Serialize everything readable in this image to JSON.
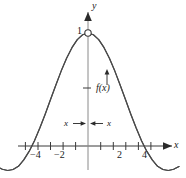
{
  "figure": {
    "title": "",
    "background": "#ffffff",
    "ink_color": "#3a3a3a",
    "text_color": "#1a1a1a"
  },
  "axes": {
    "x_axis_label": "x",
    "y_axis_label": "y",
    "x_tick_labels": [
      "−4",
      "−2",
      "2",
      "4"
    ],
    "x_tick_values": [
      -4,
      -2,
      2,
      4
    ],
    "x_minor_ticks": [
      -5,
      -4,
      -3,
      -2,
      -1,
      1,
      2,
      3,
      4,
      5
    ],
    "y_tick_labels": [
      "1"
    ],
    "y_tick_values": [
      1
    ],
    "xlim": [
      -5.1,
      5.1
    ],
    "ylim": [
      -0.35,
      1.18
    ],
    "grid": false,
    "x_axis_has_arrow": true,
    "y_axis_has_arrow": true
  },
  "annotations": {
    "function_label": "f(x)",
    "function_label_icon": "up-arrow-icon",
    "delta_left_label": "x",
    "delta_right_label": "x",
    "delta_left_arrow": "right-arrow-icon",
    "delta_right_arrow": "left-arrow-icon",
    "hole_marker": "open-circle-marker",
    "hole_point": [
      0,
      1
    ]
  },
  "chart_data": {
    "type": "line",
    "title": "",
    "xlabel": "x",
    "ylabel": "y",
    "xlim": [
      -5.1,
      5.1
    ],
    "ylim": [
      -0.35,
      1.18
    ],
    "grid": false,
    "legend": null,
    "function": "sin(x)/x",
    "removable_discontinuity": {
      "x": 0,
      "y": 1,
      "marker": "open circle"
    },
    "x_ticks": [
      -4,
      -2,
      2,
      4
    ],
    "y_ticks": [
      1
    ],
    "series": [
      {
        "name": "f(x) = sin(x)/x",
        "x": [
          -5.1,
          -4.8,
          -4.5,
          -4.2,
          -3.9,
          -3.6,
          -3.3,
          -3.0,
          -2.7,
          -2.4,
          -2.1,
          -1.8,
          -1.5,
          -1.2,
          -0.9,
          -0.6,
          -0.3,
          0.0,
          0.3,
          0.6,
          0.9,
          1.2,
          1.5,
          1.8,
          2.1,
          2.4,
          2.7,
          3.0,
          3.3,
          3.6,
          3.9,
          4.2,
          4.5,
          4.8,
          5.1
        ],
        "y": [
          -0.182,
          -0.206,
          -0.217,
          -0.208,
          -0.18,
          -0.123,
          -0.048,
          0.047,
          0.159,
          0.281,
          0.411,
          0.54,
          0.665,
          0.777,
          0.87,
          0.941,
          0.985,
          1.0,
          0.985,
          0.941,
          0.87,
          0.777,
          0.665,
          0.54,
          0.411,
          0.281,
          0.159,
          0.047,
          -0.048,
          -0.123,
          -0.18,
          -0.208,
          -0.217,
          -0.206,
          -0.182
        ]
      }
    ],
    "annotations": [
      {
        "text": "f(x)",
        "x": 0.55,
        "y": 0.4,
        "arrow": "up"
      },
      {
        "text": "x",
        "x": -0.85,
        "y": 0.17,
        "arrow": "right"
      },
      {
        "text": "x",
        "x": 0.85,
        "y": 0.17,
        "arrow": "left"
      },
      {
        "text": "1",
        "x": -0.25,
        "y": 1.0,
        "arrow": null
      }
    ]
  }
}
